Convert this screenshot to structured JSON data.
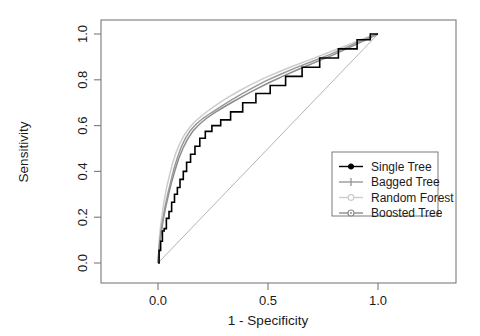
{
  "chart_data": {
    "type": "line",
    "title": "",
    "xlabel": "1 - Specificity",
    "ylabel": "Sensitivity",
    "xlim": [
      -0.28,
      1.18
    ],
    "ylim": [
      -0.09,
      1.09
    ],
    "xticks": [
      "0.0",
      "0.5",
      "1.0"
    ],
    "xtick_values": [
      0.0,
      0.5,
      1.0
    ],
    "yticks": [
      "0.0",
      "0.2",
      "0.4",
      "0.6",
      "0.8",
      "1.0"
    ],
    "ytick_values": [
      0.0,
      0.2,
      0.4,
      0.6,
      0.8,
      1.0
    ],
    "grid": false,
    "legend_position": "right-center",
    "reference_line": {
      "name": "chance-diagonal",
      "color": "#b4b4b4",
      "x": [
        0.0,
        1.0
      ],
      "y": [
        0.0,
        1.0
      ]
    },
    "series": [
      {
        "name": "Single Tree",
        "color": "#000000",
        "marker": "filled-circle",
        "style": "step",
        "x": [
          0.0,
          0.005,
          0.005,
          0.012,
          0.012,
          0.02,
          0.02,
          0.028,
          0.028,
          0.038,
          0.038,
          0.05,
          0.05,
          0.062,
          0.062,
          0.075,
          0.075,
          0.088,
          0.088,
          0.1,
          0.1,
          0.115,
          0.115,
          0.13,
          0.13,
          0.148,
          0.148,
          0.168,
          0.168,
          0.19,
          0.19,
          0.215,
          0.215,
          0.245,
          0.245,
          0.285,
          0.285,
          0.33,
          0.33,
          0.385,
          0.385,
          0.445,
          0.445,
          0.51,
          0.51,
          0.58,
          0.58,
          0.655,
          0.655,
          0.735,
          0.735,
          0.82,
          0.82,
          0.905,
          0.905,
          0.965,
          0.965,
          1.0
        ],
        "y": [
          0.0,
          0.0,
          0.055,
          0.055,
          0.095,
          0.095,
          0.14,
          0.14,
          0.15,
          0.15,
          0.195,
          0.195,
          0.225,
          0.225,
          0.265,
          0.265,
          0.3,
          0.3,
          0.33,
          0.33,
          0.365,
          0.365,
          0.4,
          0.4,
          0.44,
          0.44,
          0.475,
          0.475,
          0.51,
          0.51,
          0.545,
          0.545,
          0.575,
          0.575,
          0.6,
          0.6,
          0.625,
          0.625,
          0.66,
          0.66,
          0.7,
          0.7,
          0.74,
          0.74,
          0.775,
          0.775,
          0.815,
          0.815,
          0.855,
          0.855,
          0.895,
          0.895,
          0.935,
          0.935,
          0.975,
          0.975,
          1.0,
          1.0
        ]
      },
      {
        "name": "Bagged Tree",
        "color": "#999999",
        "marker": "plus",
        "style": "smooth",
        "x": [
          0.0,
          0.006,
          0.013,
          0.022,
          0.032,
          0.044,
          0.058,
          0.072,
          0.088,
          0.105,
          0.125,
          0.148,
          0.175,
          0.205,
          0.24,
          0.28,
          0.325,
          0.375,
          0.43,
          0.49,
          0.555,
          0.625,
          0.7,
          0.78,
          0.865,
          0.935,
          0.975,
          1.0
        ],
        "y": [
          0.0,
          0.075,
          0.135,
          0.19,
          0.245,
          0.3,
          0.355,
          0.41,
          0.46,
          0.505,
          0.545,
          0.58,
          0.608,
          0.632,
          0.655,
          0.68,
          0.707,
          0.735,
          0.765,
          0.795,
          0.823,
          0.852,
          0.88,
          0.91,
          0.945,
          0.975,
          0.992,
          1.0
        ]
      },
      {
        "name": "Random Forest",
        "color": "#cccccc",
        "marker": "open-circle",
        "style": "smooth",
        "x": [
          0.0,
          0.005,
          0.011,
          0.019,
          0.028,
          0.039,
          0.052,
          0.066,
          0.082,
          0.099,
          0.119,
          0.142,
          0.168,
          0.198,
          0.232,
          0.272,
          0.316,
          0.366,
          0.42,
          0.48,
          0.545,
          0.615,
          0.692,
          0.772,
          0.858,
          0.93,
          0.972,
          1.0
        ],
        "y": [
          0.0,
          0.09,
          0.155,
          0.215,
          0.272,
          0.328,
          0.382,
          0.435,
          0.482,
          0.522,
          0.558,
          0.59,
          0.618,
          0.642,
          0.668,
          0.695,
          0.722,
          0.75,
          0.778,
          0.806,
          0.833,
          0.86,
          0.888,
          0.918,
          0.95,
          0.978,
          0.993,
          1.0
        ]
      },
      {
        "name": "Boosted Tree",
        "color": "#8c8c8c",
        "marker": "dotted-circle",
        "style": "smooth",
        "x": [
          0.0,
          0.006,
          0.014,
          0.023,
          0.034,
          0.047,
          0.061,
          0.077,
          0.094,
          0.113,
          0.134,
          0.158,
          0.186,
          0.218,
          0.254,
          0.294,
          0.339,
          0.389,
          0.444,
          0.504,
          0.569,
          0.639,
          0.714,
          0.794,
          0.876,
          0.942,
          0.978,
          1.0
        ],
        "y": [
          0.0,
          0.068,
          0.128,
          0.185,
          0.24,
          0.295,
          0.35,
          0.404,
          0.455,
          0.5,
          0.54,
          0.575,
          0.604,
          0.63,
          0.654,
          0.678,
          0.703,
          0.73,
          0.758,
          0.787,
          0.816,
          0.846,
          0.876,
          0.908,
          0.944,
          0.973,
          0.99,
          1.0
        ]
      }
    ],
    "legend_entries": [
      {
        "label": "Single Tree",
        "color": "#000000",
        "marker": "filled-circle"
      },
      {
        "label": "Bagged Tree",
        "color": "#999999",
        "marker": "plus"
      },
      {
        "label": "Random Forest",
        "color": "#cccccc",
        "marker": "open-circle"
      },
      {
        "label": "Boosted Tree",
        "color": "#8c8c8c",
        "marker": "dotted-circle"
      }
    ]
  },
  "axes": {
    "x_title": "1 - Specificity",
    "y_title": "Sensitivity"
  },
  "colors": {
    "box": "#7a7a7a",
    "text": "#1a1a1a",
    "diagonal": "#b4b4b4",
    "background": "#ffffff"
  }
}
